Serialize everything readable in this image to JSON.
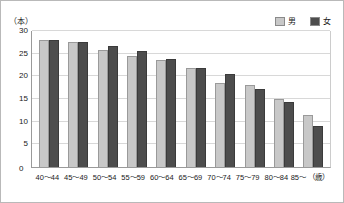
{
  "chart_data": {
    "type": "bar",
    "title": "",
    "subtitle": "",
    "xlabel": "(歳)",
    "ylabel": "(本)",
    "ylim": [
      0,
      30
    ],
    "ytick_step": 5,
    "yticks": [
      30,
      25,
      20,
      15,
      10,
      5,
      0
    ],
    "grid": true,
    "legend_position": "top-right",
    "categories": [
      "40〜44",
      "45〜49",
      "50〜54",
      "55〜59",
      "60〜64",
      "65〜69",
      "70〜74",
      "75〜79",
      "80〜84",
      "85〜"
    ],
    "series": [
      {
        "name": "男",
        "color": "#c8c8c8",
        "values": [
          28.0,
          27.5,
          25.8,
          24.5,
          23.7,
          21.8,
          18.5,
          18.2,
          15.0,
          11.5
        ]
      },
      {
        "name": "女",
        "color": "#4d4d4d",
        "values": [
          28.0,
          27.5,
          26.7,
          25.7,
          23.9,
          21.8,
          20.5,
          17.3,
          14.4,
          9.0
        ]
      }
    ]
  },
  "legend": {
    "items": [
      {
        "label": "男",
        "color": "#c8c8c8"
      },
      {
        "label": "女",
        "color": "#4d4d4d"
      }
    ]
  },
  "axis": {
    "y_unit": "（本）",
    "x_unit": "（歳）",
    "zero": "0"
  }
}
